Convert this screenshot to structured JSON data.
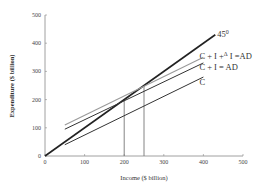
{
  "chart_data": {
    "type": "line",
    "title": "",
    "xlabel": "Income ($ billion)",
    "ylabel": "Expenditure ($ billion)",
    "xlim": [
      0,
      500
    ],
    "ylim": [
      0,
      500
    ],
    "x_ticks": [
      "0",
      "100",
      "200",
      "300",
      "400",
      "500"
    ],
    "y_ticks": [
      "0",
      "100",
      "200",
      "300",
      "400",
      "500"
    ],
    "grid": false,
    "legend": "inline labels at line ends",
    "series": [
      {
        "name": "45°",
        "label": "45",
        "label_sup": "0",
        "color": "#222222",
        "width": 1.6,
        "points": [
          [
            0,
            0
          ],
          [
            430,
            430
          ]
        ]
      },
      {
        "name": "C + I + ΔI = AD",
        "label": "C + I +",
        "label_sup": "Δ",
        "label_tail": "I =AD",
        "color": "#9a9a9a",
        "width": 1.1,
        "points": [
          [
            50,
            110
          ],
          [
            400,
            350
          ]
        ]
      },
      {
        "name": "C + I = AD",
        "label": "C + I = AD",
        "color": "#333333",
        "width": 1.0,
        "points": [
          [
            50,
            95
          ],
          [
            400,
            330
          ]
        ]
      },
      {
        "name": "C",
        "label": "C",
        "color": "#333333",
        "width": 1.0,
        "points": [
          [
            50,
            40
          ],
          [
            400,
            280
          ]
        ]
      }
    ],
    "annotations": [
      {
        "type": "vline",
        "x": 200,
        "y_top": 200,
        "color": "#777777"
      },
      {
        "type": "vline",
        "x": 250,
        "y_top": 250,
        "color": "#777777"
      }
    ]
  }
}
